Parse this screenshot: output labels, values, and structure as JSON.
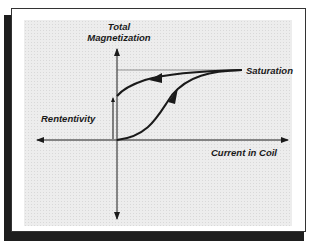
{
  "diagram": {
    "type": "magnetization-hysteresis-curve",
    "y_axis_label_line1": "Total",
    "y_axis_label_line2": "Magnetization",
    "x_axis_label": "Current in Coil",
    "saturation_label": "Saturation",
    "retentivity_label": "Rententivity",
    "colors": {
      "curve": "#1a1a1a",
      "frame": "#333333",
      "shadow": "#1e1e1e",
      "panel": "#ededed"
    }
  }
}
